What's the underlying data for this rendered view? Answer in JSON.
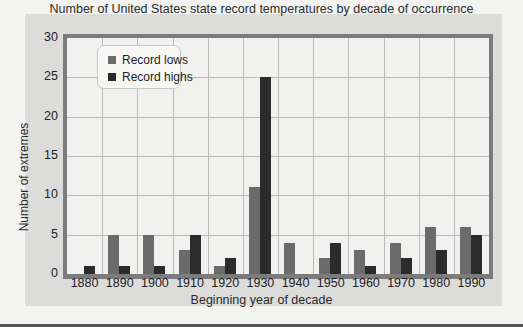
{
  "chart_data": {
    "type": "bar",
    "title": "Number of United States state record temperatures by decade of occurrence",
    "xlabel": "Beginning year of decade",
    "ylabel": "Number of extremes",
    "categories": [
      "1880",
      "1890",
      "1900",
      "1910",
      "1920",
      "1930",
      "1940",
      "1950",
      "1960",
      "1970",
      "1980",
      "1990"
    ],
    "series": [
      {
        "name": "Record lows",
        "color": "#6b6b6b",
        "values": [
          0,
          5,
          5,
          3,
          1,
          11,
          4,
          2,
          3,
          4,
          6,
          6
        ]
      },
      {
        "name": "Record highs",
        "color": "#2b2b2b",
        "values": [
          1,
          1,
          1,
          5,
          2,
          25,
          0,
          4,
          1,
          2,
          3,
          5
        ]
      }
    ],
    "ylim": [
      0,
      30
    ],
    "yticks": [
      "0",
      "5",
      "10",
      "15",
      "20",
      "25",
      "30"
    ],
    "grid": true,
    "legend_position": "upper-left"
  },
  "colors": {
    "panel_bg": "#dcdcdb",
    "plot_bg": "#f1f1f0",
    "frame": "#7c7c7c",
    "low": "#6b6b6b",
    "high": "#2b2b2b"
  }
}
